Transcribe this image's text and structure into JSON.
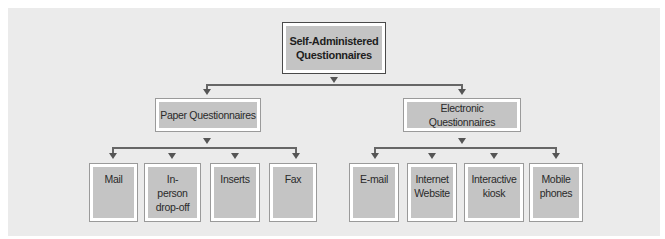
{
  "diagram": {
    "type": "hierarchy",
    "root": {
      "label": "Self-Administered Questionnaires"
    },
    "branches": [
      {
        "label": "Paper Questionnaires",
        "children": [
          {
            "label": "Mail"
          },
          {
            "label": "In-person drop-off"
          },
          {
            "label": "Inserts"
          },
          {
            "label": "Fax"
          }
        ]
      },
      {
        "label": "Electronic Questionnaires",
        "children": [
          {
            "label": "E-mail"
          },
          {
            "label": "Internet Website"
          },
          {
            "label": "Interactive kiosk"
          },
          {
            "label": "Mobile phones"
          }
        ]
      }
    ]
  },
  "colors": {
    "panel_bg": "#ebebeb",
    "box_fill": "#c4c4c4",
    "root_border": "#4a4a4a",
    "box_border": "#9a9a9a",
    "connector": "#666666"
  }
}
